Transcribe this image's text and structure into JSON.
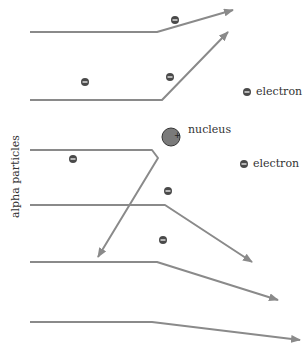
{
  "labels": {
    "nucleus": "nucleus",
    "electron_1": "electron",
    "electron_2": "electron",
    "alpha": "alpha particles"
  },
  "colors": {
    "path": "#8a8a8a",
    "electron": "#4a4a4a",
    "nucleus_fill": "#7a7a7a",
    "text": "#333333"
  },
  "paths": [
    {
      "points": "30,32 157,32 233,10"
    },
    {
      "points": "30,100 162,100 228,32"
    },
    {
      "points": "30,150 152,150 158,158 98,257"
    },
    {
      "points": "30,205 165,205 252,262"
    },
    {
      "points": "30,262 157,262 278,300"
    },
    {
      "points": "30,322 152,322 300,340"
    }
  ],
  "electrons": [
    {
      "x": 175,
      "y": 20
    },
    {
      "x": 85,
      "y": 82
    },
    {
      "x": 170,
      "y": 77
    },
    {
      "x": 73,
      "y": 159
    },
    {
      "x": 168,
      "y": 191
    },
    {
      "x": 163,
      "y": 240
    },
    {
      "x": 247,
      "y": 92
    },
    {
      "x": 244,
      "y": 164
    }
  ]
}
